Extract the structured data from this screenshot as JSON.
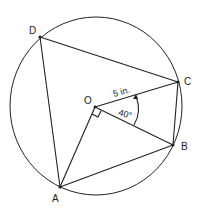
{
  "diagram": {
    "type": "inscribed quadrilateral in circle",
    "points": {
      "A": {
        "label": "A"
      },
      "B": {
        "label": "B"
      },
      "C": {
        "label": "C"
      },
      "D": {
        "label": "D"
      },
      "O": {
        "label": "O"
      }
    },
    "radius_label": "5 in.",
    "angle_label": "40°",
    "right_angle_at": "O (between OA and OB)",
    "segments": [
      "DA",
      "DC",
      "CB",
      "BA",
      "OA",
      "OB",
      "OC"
    ]
  }
}
